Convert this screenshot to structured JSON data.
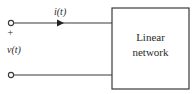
{
  "diagram": {
    "current_label": "i(t)",
    "voltage_label": "v(t)",
    "plus_sign": "+",
    "box_line1": "Linear",
    "box_line2": "network",
    "stroke_color": "#3a3a3a"
  }
}
